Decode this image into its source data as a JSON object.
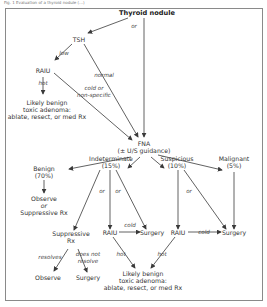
{
  "caption": "Fig. 1 Evaluation of a thyroid nodule (...)",
  "nodes": {
    "thyroid_nodule": "Thyroid nodule",
    "tsh": "TSH",
    "raiu_top": "RAIU",
    "benign_toxic_top": [
      "Likely benign",
      "toxic adenoma:",
      "ablate, resect, or med Rx"
    ],
    "fna": [
      "FNA",
      "(± U/S guidance)"
    ],
    "benign": [
      "Benign",
      "(70%)"
    ],
    "indeterminate": [
      "Indeterminate",
      "(15%)"
    ],
    "suspicious": [
      "Suspicious",
      "(10%)"
    ],
    "malignant": [
      "Malignant",
      "(5%)"
    ],
    "observe_or_suppressive": [
      "Observe",
      "or",
      "Suppressive Rx"
    ],
    "suppressive_rx": [
      "Suppressive",
      "Rx"
    ],
    "raiu_indeterminate": "RAIU",
    "surgery_indeterminate": "Surgery",
    "raiu_suspicious": "RAIU",
    "surgery_right": "Surgery",
    "observe": "Observe",
    "surgery_bottom": "Surgery",
    "benign_toxic_bottom": [
      "Likely benign",
      "toxic adenoma:",
      "ablate, resect, or med Rx"
    ]
  },
  "edge_labels": {
    "or_top": "or",
    "low": "low",
    "normal": "normal",
    "hot_top": "hot",
    "cold_or_nonspecific": [
      "cold or",
      "non-specific"
    ],
    "or_indet_1": "or",
    "or_indet_2": "or",
    "cold_indet": "cold",
    "or_susp": "or",
    "cold_susp": "cold",
    "resolves": "resolves",
    "does_not_resolve": [
      "does not",
      "resolve"
    ],
    "hot_indet": "hot",
    "hot_susp": "hot"
  },
  "colors": {
    "line": "#3a3a3a",
    "frame": "#8a8a8a",
    "text": "#333333"
  }
}
